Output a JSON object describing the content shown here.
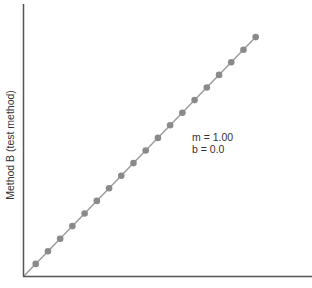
{
  "chart_data": {
    "type": "scatter",
    "title": "",
    "xlabel": "",
    "ylabel": "Method B (test method)",
    "x": [
      1,
      2,
      3,
      4,
      5,
      6,
      7,
      8,
      9,
      10,
      11,
      12,
      13,
      14,
      15,
      16,
      17,
      18,
      19
    ],
    "series": [
      {
        "name": "Method B vs Method A",
        "values": [
          1,
          2,
          3,
          4,
          5,
          6,
          7,
          8,
          9,
          10,
          11,
          12,
          13,
          14,
          15,
          16,
          17,
          18,
          19
        ]
      }
    ],
    "fit_line": {
      "slope": 1.0,
      "intercept": 0.0
    },
    "annotations": [
      "m = 1.00",
      "b = 0.0"
    ],
    "xlim": [
      0,
      23
    ],
    "ylim": [
      0,
      21.5
    ],
    "grid": false,
    "legend": "none",
    "colors": {
      "points": "#8a8a8a",
      "line": "#9a9a9a",
      "axis": "#555555"
    }
  },
  "labels": {
    "ylabel": "Method B (test method)",
    "slope": "m = 1.00",
    "intercept": "b = 0.0"
  }
}
